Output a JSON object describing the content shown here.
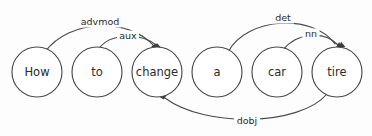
{
  "diagram": {
    "type": "dependency-parse",
    "sentence": "How to change a car tire",
    "background_color": "#fdfdfd",
    "stroke_color": "#4a4a4a",
    "text_color": "#2b2b2b",
    "nodes": [
      {
        "id": "how",
        "label": "How",
        "cx": 37,
        "cy": 72,
        "r": 25
      },
      {
        "id": "to",
        "label": "to",
        "cx": 97,
        "cy": 72,
        "r": 25
      },
      {
        "id": "change",
        "label": "change",
        "cx": 157,
        "cy": 72,
        "r": 25
      },
      {
        "id": "a",
        "label": "a",
        "cx": 217,
        "cy": 72,
        "r": 25
      },
      {
        "id": "car",
        "label": "car",
        "cx": 277,
        "cy": 72,
        "r": 25
      },
      {
        "id": "tire",
        "label": "tire",
        "cx": 337,
        "cy": 72,
        "r": 25
      }
    ],
    "edges": [
      {
        "id": "advmod",
        "label": "advmod",
        "from": "how",
        "to": "change",
        "path": "M 45 52 C 70 18, 130 18, 154 46",
        "label_x": 100,
        "label_y": 22,
        "label_w": 42,
        "arrow_x": 155,
        "arrow_y": 47,
        "arrow_angle": 58,
        "arrow_shape": "square"
      },
      {
        "id": "aux",
        "label": "aux",
        "from": "to",
        "to": "change",
        "path": "M 100 47 C 112 33, 142 33, 156 45",
        "label_x": 128,
        "label_y": 36,
        "label_w": 22,
        "arrow_x": 157,
        "arrow_y": 47,
        "arrow_angle": 48,
        "arrow_shape": "square"
      },
      {
        "id": "det",
        "label": "det",
        "from": "a",
        "to": "tire",
        "path": "M 228 52 C 248 16, 314 14, 335 44",
        "label_x": 283,
        "label_y": 18,
        "label_w": 22,
        "arrow_x": 337,
        "arrow_y": 47,
        "arrow_angle": 63,
        "arrow_shape": "triangle"
      },
      {
        "id": "nn",
        "label": "nn",
        "from": "car",
        "to": "tire",
        "path": "M 283 50 C 297 32, 325 31, 338 45",
        "label_x": 311,
        "label_y": 34,
        "label_w": 17,
        "arrow_x": 340,
        "arrow_y": 47,
        "arrow_angle": 50,
        "arrow_shape": "triangle"
      },
      {
        "id": "dobj",
        "label": "dobj",
        "from": "tire",
        "to": "change",
        "path": "M 327 94 C 300 126, 205 128, 165 98",
        "label_x": 247,
        "label_y": 121,
        "label_w": 26,
        "arrow_x": 163,
        "arrow_y": 96,
        "arrow_angle": -145,
        "arrow_shape": "square"
      }
    ]
  }
}
